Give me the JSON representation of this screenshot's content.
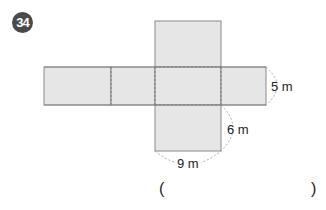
{
  "problem": {
    "number": "34",
    "dimensions": {
      "height_label": "5 m",
      "depth_label": "6 m",
      "width_label": "9 m"
    },
    "answer": {
      "open_paren": "(",
      "close_paren": ")",
      "value": ""
    }
  },
  "colors": {
    "face_fill": "#e6e6e6",
    "edge": "#8a8a8a",
    "badge": "#4a4a4a"
  }
}
